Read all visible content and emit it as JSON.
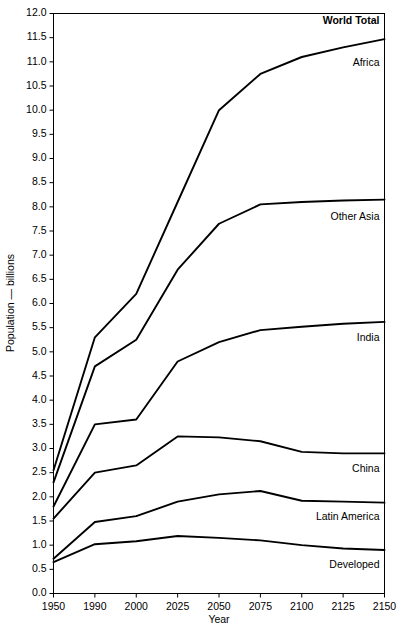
{
  "chart_data": {
    "type": "line",
    "title": "",
    "xlabel": "Year",
    "ylabel": "Population — billions",
    "categories": [
      "1950",
      "1990",
      "2000",
      "2025",
      "2050",
      "2075",
      "2100",
      "2125",
      "2150"
    ],
    "ylim": [
      0.0,
      12.0
    ],
    "ytick_step": 0.5,
    "ytick_labels": [
      "0.0",
      "0.5",
      "1.0",
      "1.5",
      "2.0",
      "2.5",
      "3.0",
      "3.5",
      "4.0",
      "4.5",
      "5.0",
      "5.5",
      "6.0",
      "6.5",
      "7.0",
      "7.5",
      "8.0",
      "8.5",
      "9.0",
      "9.5",
      "10.0",
      "10.5",
      "11.0",
      "11.5",
      "12.0"
    ],
    "grid": false,
    "legend_position": "right-inline",
    "note": "Cumulative stacked band boundaries; each line is a running total. Top line is World Total.",
    "series": [
      {
        "name": "World Total",
        "label": "World Total",
        "bold": true,
        "values": [
          2.55,
          5.3,
          6.2,
          8.1,
          10.0,
          10.75,
          11.1,
          11.3,
          11.47
        ]
      },
      {
        "name": "Africa",
        "label": "Africa",
        "bold": false,
        "values": [
          2.3,
          4.7,
          5.25,
          6.7,
          7.65,
          8.05,
          8.1,
          8.13,
          8.15
        ]
      },
      {
        "name": "Other Asia",
        "label": "Other Asia",
        "bold": false,
        "values": [
          1.8,
          3.5,
          3.6,
          4.8,
          5.2,
          5.45,
          5.52,
          5.58,
          5.62
        ]
      },
      {
        "name": "India",
        "label": "India",
        "bold": false,
        "values": [
          1.55,
          2.5,
          2.65,
          3.25,
          3.23,
          3.15,
          2.93,
          2.9,
          2.9
        ]
      },
      {
        "name": "China",
        "label": "China",
        "bold": false,
        "values": [
          0.72,
          1.48,
          1.6,
          1.9,
          2.05,
          2.12,
          1.92,
          1.9,
          1.88
        ]
      },
      {
        "name": "Latin America",
        "label": "Latin America",
        "bold": false,
        "values": [
          0.65,
          1.02,
          1.08,
          1.19,
          1.15,
          1.1,
          1.0,
          0.93,
          0.9
        ]
      }
    ],
    "inline_labels": [
      {
        "text": "World Total",
        "bold": true,
        "y_value": 11.78
      },
      {
        "text": "Africa",
        "bold": false,
        "y_value": 10.92
      },
      {
        "text": "Other Asia",
        "bold": false,
        "y_value": 7.72
      },
      {
        "text": "India",
        "bold": false,
        "y_value": 5.22
      },
      {
        "text": "China",
        "bold": false,
        "y_value": 2.52
      },
      {
        "text": "Latin America",
        "bold": false,
        "y_value": 1.52
      },
      {
        "text": "Developed",
        "bold": false,
        "y_value": 0.53
      }
    ],
    "extra_band_name": "Developed"
  }
}
